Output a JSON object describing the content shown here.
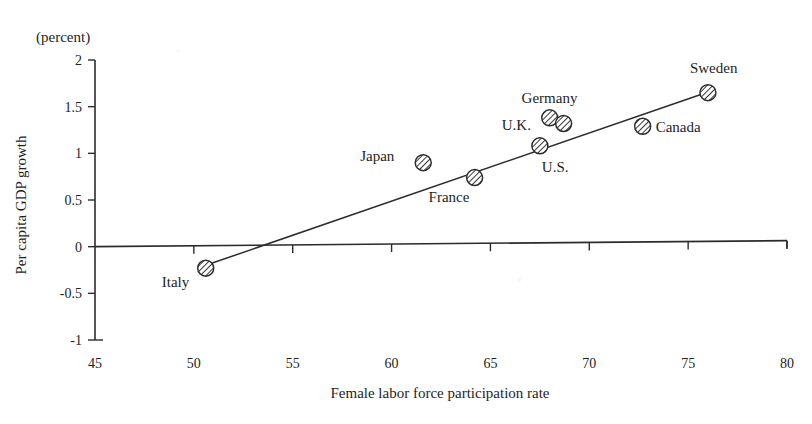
{
  "chart_data": {
    "type": "scatter",
    "title": "",
    "unit_note": "(percent)",
    "xlabel": "Female labor force participation rate",
    "ylabel": "Per capita GDP growth",
    "xlim": [
      45,
      80
    ],
    "ylim": [
      -1,
      2
    ],
    "xticks": [
      45,
      50,
      55,
      60,
      65,
      70,
      75,
      80
    ],
    "xtick_labels": [
      "45",
      "50",
      "55",
      "60",
      "65",
      "70",
      "75",
      "80"
    ],
    "yticks": [
      -1,
      -0.5,
      0,
      0.5,
      1,
      1.5,
      2
    ],
    "ytick_labels": [
      "-1",
      "-0.5",
      "0",
      "0.5",
      "1",
      "1.5",
      "2"
    ],
    "grid": false,
    "legend": "none",
    "zero_line": true,
    "points": [
      {
        "label": "Italy",
        "x": 50.6,
        "y": -0.23,
        "label_dx": -44,
        "label_dy": 19
      },
      {
        "label": "Japan",
        "x": 61.6,
        "y": 0.9,
        "label_dx": -63,
        "label_dy": -2
      },
      {
        "label": "France",
        "x": 64.2,
        "y": 0.74,
        "label_dx": -46,
        "label_dy": 24
      },
      {
        "label": "U.S.",
        "x": 67.5,
        "y": 1.08,
        "label_dx": 2,
        "label_dy": 26
      },
      {
        "label": "U.K.",
        "x": 68.0,
        "y": 1.38,
        "label_dx": -48,
        "label_dy": 12
      },
      {
        "label": "Germany",
        "x": 68.7,
        "y": 1.32,
        "label_dx": -42,
        "label_dy": -20
      },
      {
        "label": "Canada",
        "x": 72.7,
        "y": 1.29,
        "label_dx": 13,
        "label_dy": 6
      },
      {
        "label": "Sweden",
        "x": 76.0,
        "y": 1.65,
        "label_dx": -18,
        "label_dy": -20
      }
    ],
    "trendline": {
      "x_start": 50.6,
      "y_start": -0.2,
      "x_end": 75.9,
      "y_end": 1.65,
      "zero_crossing_x": 52.3
    }
  }
}
